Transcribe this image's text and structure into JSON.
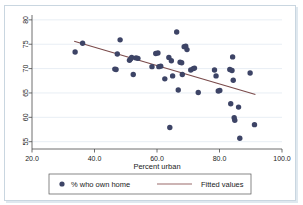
{
  "chart_data": {
    "type": "scatter",
    "title": "",
    "xlabel": "Percent urban",
    "ylabel": "",
    "xlim": [
      20.0,
      100.0
    ],
    "ylim": [
      53.5,
      81.0
    ],
    "xticks": [
      "20.0",
      "40.0",
      "60.0",
      "80.0",
      "100.0"
    ],
    "xtick_values": [
      20,
      40,
      60,
      80,
      100
    ],
    "yticks": [
      "55",
      "60",
      "65",
      "70",
      "75",
      "80"
    ],
    "ytick_values": [
      55,
      60,
      65,
      70,
      75,
      80
    ],
    "grid": "horizontal",
    "legend_position": "bottom",
    "series": [
      {
        "name": "% who own home",
        "type": "scatter",
        "marker": "circle",
        "color": "#3d4466",
        "points": [
          [
            33.8,
            73.4
          ],
          [
            36.2,
            75.2
          ],
          [
            46.5,
            69.9
          ],
          [
            46.9,
            69.8
          ],
          [
            47.3,
            73.0
          ],
          [
            48.2,
            75.9
          ],
          [
            51.2,
            71.7
          ],
          [
            51.6,
            72.0
          ],
          [
            51.9,
            72.3
          ],
          [
            52.4,
            68.8
          ],
          [
            53.3,
            72.2
          ],
          [
            53.9,
            72.1
          ],
          [
            58.4,
            70.4
          ],
          [
            59.6,
            73.1
          ],
          [
            60.3,
            73.2
          ],
          [
            60.6,
            70.4
          ],
          [
            61.2,
            70.5
          ],
          [
            62.5,
            67.9
          ],
          [
            63.8,
            72.3
          ],
          [
            64.1,
            57.9
          ],
          [
            64.6,
            71.6
          ],
          [
            65.0,
            68.5
          ],
          [
            66.3,
            77.5
          ],
          [
            66.8,
            65.6
          ],
          [
            67.4,
            71.3
          ],
          [
            67.9,
            71.2
          ],
          [
            68.1,
            68.8
          ],
          [
            68.7,
            74.5
          ],
          [
            69.2,
            74.6
          ],
          [
            69.6,
            73.9
          ],
          [
            70.8,
            69.7
          ],
          [
            71.6,
            70.0
          ],
          [
            72.0,
            70.1
          ],
          [
            73.2,
            65.1
          ],
          [
            78.4,
            69.7
          ],
          [
            78.9,
            68.5
          ],
          [
            79.6,
            65.4
          ],
          [
            80.1,
            65.5
          ],
          [
            83.3,
            69.8
          ],
          [
            83.6,
            62.8
          ],
          [
            84.0,
            69.6
          ],
          [
            84.2,
            72.4
          ],
          [
            84.4,
            67.6
          ],
          [
            84.7,
            59.9
          ],
          [
            84.9,
            59.4
          ],
          [
            86.1,
            62.1
          ],
          [
            86.5,
            55.7
          ],
          [
            89.8,
            69.1
          ],
          [
            91.2,
            58.5
          ]
        ]
      },
      {
        "name": "Fitted values",
        "type": "line",
        "color": "#7a4a4a",
        "x_start": 33.5,
        "y_start": 75.6,
        "x_end": 91.5,
        "y_end": 64.7
      }
    ]
  },
  "legend": {
    "marker_label": "% who own home",
    "line_label": "Fitted values"
  },
  "axis": {
    "x_title": "Percent urban"
  },
  "colors": {
    "marker": "#3d4466",
    "fit_line": "#7a4a4a",
    "grid": "#e8eef4",
    "axis": "#4a4a4a",
    "frame": "#c9d6e0"
  }
}
